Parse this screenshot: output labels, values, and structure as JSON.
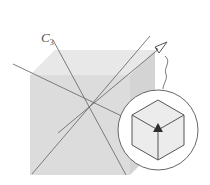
{
  "figure": {
    "axis_label": {
      "main": "C",
      "subscript": "3"
    },
    "colors": {
      "cube_top": "#e6e6e6",
      "cube_front": "#d9d9d9",
      "cube_side": "#cfcfcf",
      "lines": "#6b6b6b",
      "inset_fill": "#ffffff",
      "inset_cube_faces": "#ececec",
      "triangle_symbol": "#333333"
    },
    "inset": {
      "shape": "circle",
      "content": "cube viewed along 3-fold axis (hexagon outline)",
      "symbol": "filled-triangle"
    }
  }
}
